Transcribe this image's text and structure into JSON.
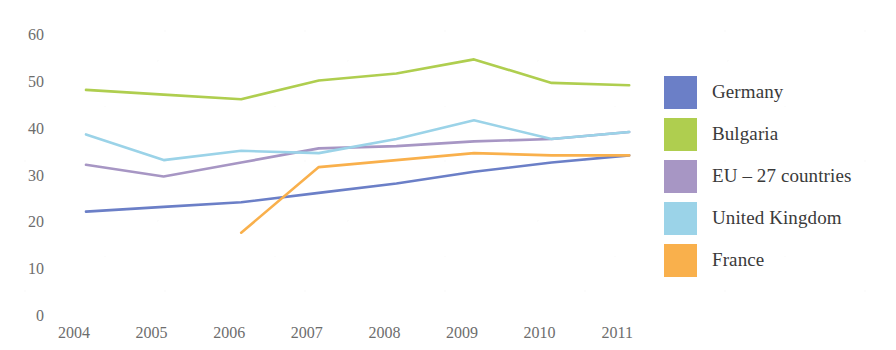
{
  "chart_data": {
    "type": "line",
    "title": "",
    "xlabel": "",
    "ylabel": "",
    "categories": [
      "2004",
      "2005",
      "2006",
      "2007",
      "2008",
      "2009",
      "2010",
      "2011"
    ],
    "ylim": [
      0,
      60
    ],
    "y_ticks": [
      0,
      10,
      20,
      30,
      40,
      50,
      60
    ],
    "y_tick_labels": [
      "0",
      "10",
      "20",
      "30",
      "40",
      "50",
      "60"
    ],
    "grid": false,
    "legend_position": "right",
    "series": [
      {
        "name": "Germany",
        "color": "#6B7FC7",
        "values": [
          22.5,
          23.5,
          24.5,
          26.5,
          28.5,
          31.0,
          33.0,
          34.5
        ]
      },
      {
        "name": "Bulgaria",
        "color": "#AFCE4F",
        "values": [
          48.5,
          47.5,
          46.5,
          50.5,
          52.0,
          55.0,
          50.0,
          49.5
        ]
      },
      {
        "name": "EU – 27 countries",
        "color": "#A796C4",
        "values": [
          32.5,
          30.0,
          33.0,
          36.0,
          36.5,
          37.5,
          38.0,
          39.5
        ]
      },
      {
        "name": "United Kingdom",
        "color": "#9BD3E8",
        "values": [
          39.0,
          33.5,
          35.5,
          35.0,
          38.0,
          42.0,
          38.0,
          39.5
        ]
      },
      {
        "name": "France",
        "color": "#F9B04C",
        "values": [
          null,
          null,
          18.0,
          32.0,
          33.5,
          35.0,
          34.5,
          34.5
        ]
      }
    ]
  },
  "legend": {
    "items": [
      {
        "label": "Germany",
        "color": "#6B7FC7"
      },
      {
        "label": "Bulgaria",
        "color": "#AFCE4F"
      },
      {
        "label": "EU – 27 countries",
        "color": "#A796C4"
      },
      {
        "label": "United Kingdom",
        "color": "#9BD3E8"
      },
      {
        "label": "France",
        "color": "#F9B04C"
      }
    ]
  },
  "title_sliver": ""
}
